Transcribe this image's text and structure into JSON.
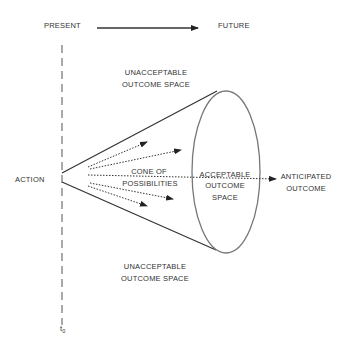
{
  "labels": {
    "present": "PRESENT",
    "future": "FUTURE",
    "unacceptable_top_1": "UNACCEPTABLE",
    "unacceptable_top_2": "OUTCOME SPACE",
    "unacceptable_bottom_1": "UNACCEPTABLE",
    "unacceptable_bottom_2": "OUTCOME SPACE",
    "action": "ACTION",
    "cone_1": "CONE OF",
    "cone_2": "POSSIBILITIES",
    "acceptable_1": "ACCEPTABLE",
    "acceptable_2": "OUTCOME",
    "acceptable_3": "SPACE",
    "anticipated_1": "ANTICIPATED",
    "anticipated_2": "OUTCOME",
    "t0_base": "t",
    "t0_sub": "0"
  },
  "colors": {
    "line": "#333333",
    "ellipse": "#777777",
    "text": "#333333"
  }
}
